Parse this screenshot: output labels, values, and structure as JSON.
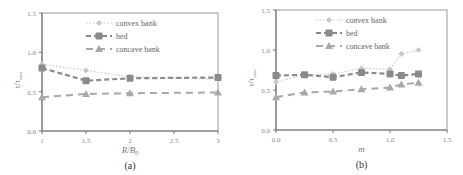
{
  "chart_data": [
    {
      "type": "line",
      "panel_label": "(a)",
      "xlabel": "R/B0",
      "ylabel": "τ/τmax",
      "xlim": [
        1,
        3
      ],
      "ylim": [
        0,
        1.5
      ],
      "xticks": [
        "1",
        "1.5",
        "2",
        "2.5",
        "3"
      ],
      "yticks": [
        "0.0",
        "0.5",
        "1.0",
        "1.5"
      ],
      "grid": false,
      "legend_position": "upper center",
      "x": [
        1,
        1.5,
        2,
        3
      ],
      "series": [
        {
          "name": "convex bank",
          "values": [
            0.85,
            0.77,
            0.69,
            0.66
          ],
          "style": "dotted",
          "marker": "diamond",
          "color": "#c8c8c8"
        },
        {
          "name": "bed",
          "values": [
            0.8,
            0.64,
            0.67,
            0.68
          ],
          "style": "dashed",
          "marker": "square",
          "color": "#8a8a8a"
        },
        {
          "name": "concave bank",
          "values": [
            0.43,
            0.47,
            0.48,
            0.49
          ],
          "style": "long-dashed",
          "marker": "triangle",
          "color": "#a8a8a8"
        }
      ]
    },
    {
      "type": "line",
      "panel_label": "(b)",
      "xlabel": "m",
      "ylabel": "τ/τmax",
      "xlim": [
        0,
        1.5
      ],
      "ylim": [
        0,
        1.5
      ],
      "xticks": [
        "0.0",
        "0.5",
        "1.0",
        "1.5"
      ],
      "yticks": [
        "0.0",
        "0.5",
        "1.0",
        "1.5"
      ],
      "grid": false,
      "legend_position": "upper center",
      "x": [
        0,
        0.25,
        0.5,
        0.75,
        1.0,
        1.1,
        1.25
      ],
      "series": [
        {
          "name": "convex bank",
          "values": [
            0.6,
            0.69,
            0.7,
            0.77,
            0.76,
            0.95,
            1.0
          ],
          "style": "dotted",
          "marker": "diamond",
          "color": "#c8c8c8"
        },
        {
          "name": "bed",
          "values": [
            0.68,
            0.69,
            0.66,
            0.72,
            0.7,
            0.68,
            0.7
          ],
          "style": "dashed",
          "marker": "square",
          "color": "#8a8a8a"
        },
        {
          "name": "concave bank",
          "values": [
            0.41,
            0.47,
            0.48,
            0.51,
            0.53,
            0.57,
            0.59
          ],
          "style": "long-dashed",
          "marker": "triangle",
          "color": "#a8a8a8"
        }
      ]
    }
  ],
  "labels": {
    "a": {
      "panel": "(a)",
      "xlabel_main": "R/B",
      "xlabel_sub": "0",
      "ylabel_main": "τ/τ",
      "ylabel_sub": "max"
    },
    "b": {
      "panel": "(b)",
      "xlabel": "m",
      "ylabel_main": "τ/τ",
      "ylabel_sub": "max"
    }
  }
}
